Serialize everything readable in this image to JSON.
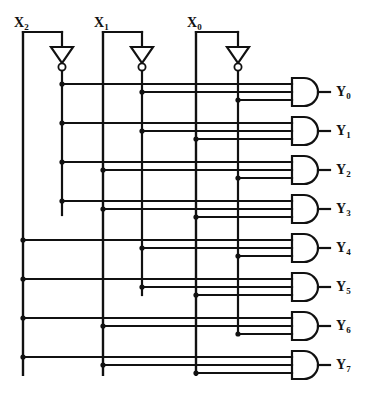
{
  "diagram": {
    "type": "logic-circuit",
    "line_color": "#111111",
    "background": "#ffffff"
  },
  "inputs": [
    {
      "name": "X2",
      "base": "X",
      "sub": "2",
      "label_x": 14,
      "label_y": 16,
      "stem_x": 23,
      "tap_y": 32,
      "inverter_x": 62
    },
    {
      "name": "X1",
      "base": "X",
      "sub": "1",
      "label_x": 94,
      "label_y": 16,
      "stem_x": 103,
      "tap_y": 32,
      "inverter_x": 142
    },
    {
      "name": "X0",
      "base": "X",
      "sub": "0",
      "label_x": 187,
      "label_y": 16,
      "stem_x": 196,
      "tap_y": 32,
      "inverter_x": 238
    }
  ],
  "inverters": [
    {
      "name": "inverter-x2",
      "x": 62,
      "top_y": 47,
      "tip_y": 63,
      "bubble_cy": 67,
      "half_width": 11
    },
    {
      "name": "inverter-x1",
      "x": 142,
      "top_y": 47,
      "tip_y": 63,
      "bubble_cy": 67,
      "half_width": 11
    },
    {
      "name": "inverter-x0",
      "x": 238,
      "top_y": 47,
      "tip_y": 63,
      "bubble_cy": 67,
      "half_width": 11
    }
  ],
  "rails": [
    {
      "name": "rail-x2-true",
      "signal": "X2",
      "x": 23,
      "y_top": 32,
      "y_bottom": 375
    },
    {
      "name": "rail-x2-bar",
      "signal": "X2'",
      "x": 62,
      "y_top": 71,
      "y_bottom": 215
    },
    {
      "name": "rail-x1-true",
      "signal": "X1",
      "x": 103,
      "y_top": 32,
      "y_bottom": 375
    },
    {
      "name": "rail-x1-bar",
      "signal": "X1'",
      "x": 142,
      "y_top": 71,
      "y_bottom": 295
    },
    {
      "name": "rail-x0-true",
      "signal": "X0",
      "x": 196,
      "y_top": 32,
      "y_bottom": 375
    },
    {
      "name": "rail-x0-bar",
      "signal": "X0'",
      "x": 238,
      "y_top": 71,
      "y_bottom": 335
    }
  ],
  "gates": {
    "body_left": 292,
    "body_right": 318,
    "height": 28,
    "input_stub_left": 246,
    "output_stub_right": 330,
    "rows": [
      {
        "name": "gate-y0",
        "out": "Y0",
        "base": "Y",
        "sub": "0",
        "cy": 92,
        "label_x": 336,
        "label_y": 85,
        "inputs": [
          62,
          142,
          238
        ]
      },
      {
        "name": "gate-y1",
        "out": "Y1",
        "base": "Y",
        "sub": "1",
        "cy": 131,
        "label_x": 336,
        "label_y": 124,
        "inputs": [
          62,
          142,
          196
        ]
      },
      {
        "name": "gate-y2",
        "out": "Y2",
        "base": "Y",
        "sub": "2",
        "cy": 170,
        "label_x": 336,
        "label_y": 163,
        "inputs": [
          62,
          103,
          238
        ]
      },
      {
        "name": "gate-y3",
        "out": "Y3",
        "base": "Y",
        "sub": "3",
        "cy": 209,
        "label_x": 336,
        "label_y": 202,
        "inputs": [
          62,
          103,
          196
        ]
      },
      {
        "name": "gate-y4",
        "out": "Y4",
        "base": "Y",
        "sub": "4",
        "cy": 248,
        "label_x": 336,
        "label_y": 241,
        "inputs": [
          23,
          142,
          238
        ]
      },
      {
        "name": "gate-y5",
        "out": "Y5",
        "base": "Y",
        "sub": "5",
        "cy": 287,
        "label_x": 336,
        "label_y": 280,
        "inputs": [
          23,
          142,
          196
        ]
      },
      {
        "name": "gate-y6",
        "out": "Y6",
        "base": "Y",
        "sub": "6",
        "cy": 326,
        "label_x": 336,
        "label_y": 319,
        "inputs": [
          23,
          103,
          238
        ]
      },
      {
        "name": "gate-y7",
        "out": "Y7",
        "base": "Y",
        "sub": "7",
        "cy": 365,
        "label_x": 336,
        "label_y": 358,
        "inputs": [
          23,
          103,
          196
        ]
      }
    ]
  }
}
